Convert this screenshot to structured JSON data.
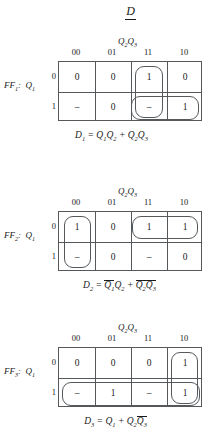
{
  "title": "D",
  "maps": [
    {
      "id": "ff1",
      "label": "FF",
      "label_sub": "1",
      "label_suffix": ":  Q",
      "label_suffix_sub": "1",
      "col_header": "Q₂Q₃",
      "col_header_base1": "Q",
      "col_header_sub1": "2",
      "col_header_base2": "Q",
      "col_header_sub2": "3",
      "columns": [
        "00",
        "01",
        "11",
        "10"
      ],
      "rows": [
        "0",
        "1"
      ],
      "cells": [
        [
          "0",
          "0",
          "1",
          "0"
        ],
        [
          "–",
          "0",
          "–",
          "1"
        ]
      ],
      "groups": [
        {
          "name": "group-column-11",
          "col": 2,
          "row": 0,
          "colspan": 1,
          "rowspan": 2
        },
        {
          "name": "group-row1-11-10",
          "col": 2,
          "row": 1,
          "colspan": 2,
          "rowspan": 1
        }
      ],
      "equation": "D₁ = Q₁Q₂ + Q₂Q₃",
      "equation_parts": [
        {
          "t": "D",
          "sub": "3",
          "bar": false
        },
        {
          "t": " = ",
          "sub": "",
          "bar": false
        }
      ]
    },
    {
      "id": "ff2",
      "label": "FF",
      "label_sub": "2",
      "label_suffix": ":  Q",
      "label_suffix_sub": "1",
      "columns": [
        "00",
        "01",
        "11",
        "10"
      ],
      "rows": [
        "0",
        "1"
      ],
      "cells": [
        [
          "1",
          "0",
          "1",
          "1"
        ],
        [
          "–",
          "0",
          "–",
          "0"
        ]
      ],
      "groups": [
        {
          "name": "group-column-00",
          "col": 0,
          "row": 0,
          "colspan": 1,
          "rowspan": 2
        },
        {
          "name": "group-row0-11-10",
          "col": 2,
          "row": 0,
          "colspan": 2,
          "rowspan": 1
        }
      ],
      "equation": "D₂ = Q̅₁Q₂ + Q̅₂Q̅₃"
    },
    {
      "id": "ff3",
      "label": "FF",
      "label_sub": "3",
      "label_suffix": ":  Q",
      "label_suffix_sub": "1",
      "columns": [
        "00",
        "01",
        "11",
        "10"
      ],
      "rows": [
        "0",
        "1"
      ],
      "cells": [
        [
          "0",
          "0",
          "0",
          "1"
        ],
        [
          "–",
          "1",
          "–",
          "1"
        ]
      ],
      "groups": [
        {
          "name": "group-row1-all",
          "col": 0,
          "row": 1,
          "colspan": 4,
          "rowspan": 1
        },
        {
          "name": "group-column-10",
          "col": 3,
          "row": 0,
          "colspan": 1,
          "rowspan": 2
        }
      ],
      "equation": "D₃ = Q₁ + Q₂Q̅₃"
    }
  ],
  "equations": {
    "d1": {
      "lhs": "D",
      "lhs_sub": "1",
      "eq": " = ",
      "term1_a": "Q",
      "term1_a_sub": "1",
      "term1_a_bar": false,
      "term1_b": "Q",
      "term1_b_sub": "2",
      "term1_b_bar": false,
      "plus": " + ",
      "term2_a": "Q",
      "term2_a_sub": "2",
      "term2_a_bar": false,
      "term2_b": "Q",
      "term2_b_sub": "3",
      "term2_b_bar": false
    },
    "d2": {
      "lhs": "D",
      "lhs_sub": "2",
      "eq": " = ",
      "term1_a": "Q",
      "term1_a_sub": "1",
      "term1_a_bar": true,
      "term1_b": "Q",
      "term1_b_sub": "2",
      "term1_b_bar": false,
      "plus": " + ",
      "term2_a": "Q",
      "term2_a_sub": "2",
      "term2_a_bar": true,
      "term2_b": "Q",
      "term2_b_sub": "3",
      "term2_b_bar": true
    },
    "d3": {
      "lhs": "D",
      "lhs_sub": "3",
      "eq": " = ",
      "term1_a": "Q",
      "term1_a_sub": "1",
      "term1_a_bar": false,
      "term1_b": "",
      "term1_b_sub": "",
      "term1_b_bar": false,
      "plus": " + ",
      "term2_a": "Q",
      "term2_a_sub": "2",
      "term2_a_bar": false,
      "term2_b": "Q",
      "term2_b_sub": "3",
      "term2_b_bar": true
    }
  },
  "colors": {
    "grid_line": "#55595c",
    "text": "#1a1a1a",
    "background": "#ffffff"
  }
}
